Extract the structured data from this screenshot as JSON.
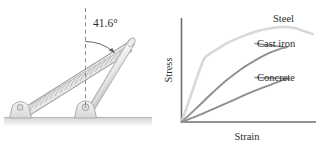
{
  "figure": {
    "background_color": "#ffffff",
    "ink_color": "#808080"
  },
  "mechanism": {
    "angle_label": "41.6°",
    "angle_value": 41.6,
    "angle_unit": "degrees",
    "reference_line": "vertical-dashed",
    "parts": {
      "spring_label": "spring",
      "rod_label": "rod",
      "left_mount_label": "pin-support-left",
      "right_mount_label": "pin-support-right",
      "ground_label": "ground"
    },
    "colors": {
      "outline": "#a8a8a8",
      "fill": "#e8e8e8",
      "spring_fill": "#e2e2e2",
      "ground": "#bdbdbd",
      "dashed": "#8a8a8a",
      "arc": "#595959"
    }
  },
  "chart_data": {
    "type": "line",
    "title": "",
    "xlabel": "Strain",
    "ylabel": "Stress",
    "grid": false,
    "legend_position": "inline-right-of-curve",
    "xlim": [
      0,
      1
    ],
    "ylim": [
      0,
      1
    ],
    "axis_ticks": false,
    "annotations": [
      "Steel",
      "Cast iron",
      "Concrete"
    ],
    "series": [
      {
        "name": "Steel",
        "color": "#d8d8d8",
        "label": "Steel",
        "x": [
          0.0,
          0.06,
          0.12,
          0.17,
          0.21,
          0.27,
          0.36,
          0.47,
          0.58,
          0.69,
          0.78,
          0.86,
          0.93,
          1.0
        ],
        "y": [
          0.0,
          0.22,
          0.45,
          0.62,
          0.67,
          0.72,
          0.79,
          0.85,
          0.9,
          0.93,
          0.94,
          0.93,
          0.9,
          0.87
        ]
      },
      {
        "name": "Cast iron",
        "color": "#909090",
        "label": "Cast iron",
        "x": [
          0.0,
          0.1,
          0.22,
          0.34,
          0.45,
          0.56,
          0.66,
          0.74,
          0.8
        ],
        "y": [
          0.0,
          0.12,
          0.27,
          0.41,
          0.52,
          0.61,
          0.68,
          0.72,
          0.74
        ]
      },
      {
        "name": "Concrete",
        "color": "#8f8f8f",
        "label": "Concrete",
        "x": [
          0.0,
          0.12,
          0.26,
          0.4,
          0.54,
          0.66,
          0.76,
          0.82
        ],
        "y": [
          0.0,
          0.06,
          0.14,
          0.22,
          0.3,
          0.36,
          0.41,
          0.43
        ]
      }
    ],
    "axis_color": "#6e6e6e"
  }
}
